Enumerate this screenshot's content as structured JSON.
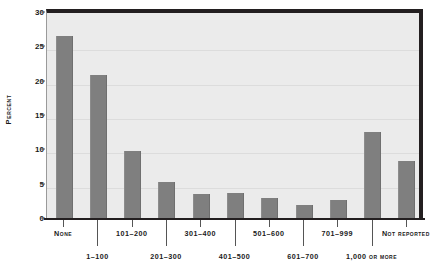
{
  "chart_data": {
    "type": "bar",
    "title": "",
    "subtitle": "",
    "xlabel": "",
    "ylabel": "Percent",
    "ylim": [
      0,
      30
    ],
    "yticks": [
      0,
      5,
      10,
      15,
      20,
      25,
      30
    ],
    "grid": true,
    "legend": false,
    "categories": [
      "None",
      "1–100",
      "101–200",
      "201–300",
      "301–400",
      "401–500",
      "501–600",
      "601–700",
      "701–999",
      "1,000 or more",
      "Not reported"
    ],
    "values": [
      26.6,
      21.0,
      9.9,
      5.4,
      3.6,
      3.8,
      3.0,
      2.0,
      2.8,
      12.7,
      8.5
    ],
    "bar_color": "#7f7f7f",
    "plot_background": "#ebebeb",
    "axis_color": "#231f20",
    "label_rows": [
      1,
      2,
      1,
      2,
      1,
      2,
      1,
      2,
      1,
      2,
      1
    ]
  }
}
